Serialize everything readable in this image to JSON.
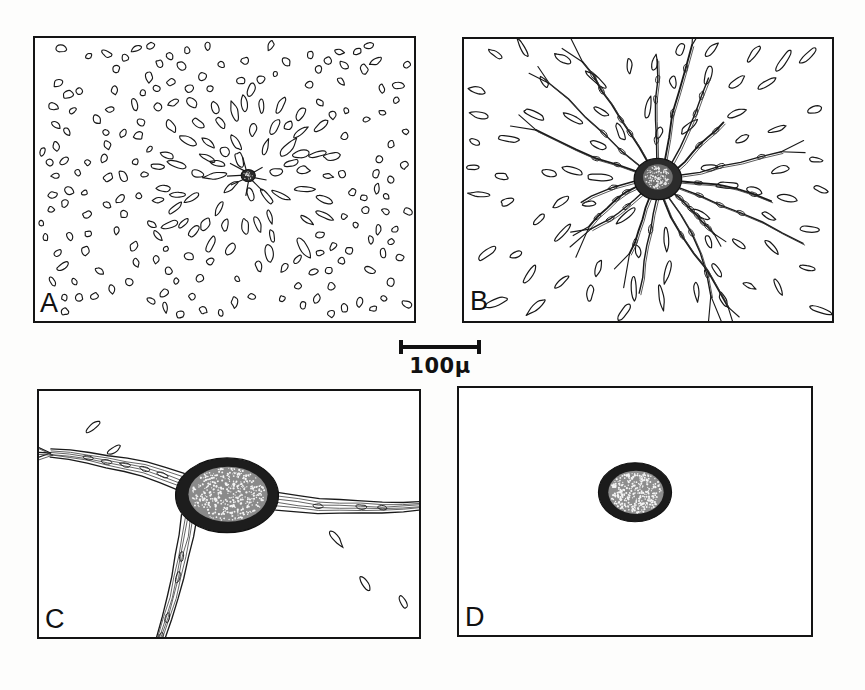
{
  "figure": {
    "type": "scientific-line-drawing-plate",
    "layout": "2x2 grid of framed camera-lucida drawings with a central scale bar",
    "background_color": "#fdfdfc",
    "ink_color": "#141414",
    "panels": [
      {
        "id": "A",
        "label": "A",
        "description": "Low magnification field densely packed with small outlined oval and rod-shaped nuclei; a single small dark stippled cell body with short radiating processes sits near the centre.",
        "magnification_rank": 1,
        "cell_count_approx": 250,
        "has_central_cell": true,
        "central_cell": {
          "style": "small dark stippled soma with short radiating spikes",
          "x_pct": 56,
          "y_pct": 47
        }
      },
      {
        "id": "B",
        "label": "B",
        "description": "Higher magnification of a stellate cell: dark stippled soma with long, branching, beaded processes radiating in all directions through a sparse field of elongated nuclei.",
        "magnification_rank": 2,
        "cell_count_approx": 70,
        "has_central_cell": true,
        "central_cell": {
          "style": "round dark stippled soma with many branching processes",
          "x_pct": 52,
          "y_pct": 50
        }
      },
      {
        "id": "C",
        "label": "C",
        "description": "Still higher magnification: large oval soma with dark rim and pale stippled interior, with thick bundled fibre tracts leaving to the upper-left and to the right, branching at their ends.",
        "magnification_rank": 3,
        "cell_count_approx": 5,
        "has_central_cell": true,
        "central_cell": {
          "style": "large oval soma, dark rim, stippled pale centre",
          "x_pct": 48,
          "y_pct": 40
        }
      },
      {
        "id": "D",
        "label": "D",
        "description": "Isolated soma only: a single oval cell body with dark border and stippled interior, no processes, on an empty field.",
        "magnification_rank": 4,
        "cell_count_approx": 1,
        "has_central_cell": true,
        "central_cell": {
          "style": "isolated oval stippled soma, no processes",
          "x_pct": 50,
          "y_pct": 42
        }
      }
    ],
    "scale_bar": {
      "label": "100μ",
      "value": 100,
      "unit": "μ",
      "unit_name": "micron",
      "position": "between the upper and lower rows, horizontally centred"
    }
  }
}
